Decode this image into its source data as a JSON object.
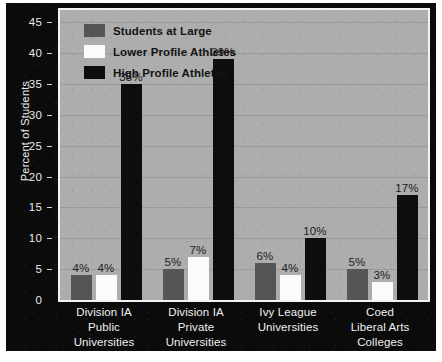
{
  "chart_data": {
    "type": "bar",
    "title": "",
    "xlabel": "",
    "ylabel": "Percent of Students",
    "ylim": [
      0,
      47
    ],
    "yticks": [
      0,
      5,
      10,
      15,
      20,
      25,
      30,
      35,
      40,
      45
    ],
    "grid": true,
    "legend_position": "top-left",
    "categories": [
      "Division IA Public Universities",
      "Division IA Private Universities",
      "Ivy League Universities",
      "Coed Liberal Arts Colleges"
    ],
    "category_lines": [
      [
        "Division IA",
        "Public",
        "Universities"
      ],
      [
        "Division IA",
        "Private",
        "Universities"
      ],
      [
        "Ivy League",
        "Universities"
      ],
      [
        "Coed",
        "Liberal Arts",
        "Colleges"
      ]
    ],
    "series": [
      {
        "name": "Students at Large",
        "color": "#555555",
        "values": [
          4,
          5,
          6,
          5
        ],
        "labels": [
          "4%",
          "5%",
          "6%",
          "5%"
        ]
      },
      {
        "name": "Lower Profile Athletes",
        "color": "#fbfbfb",
        "values": [
          4,
          7,
          4,
          3
        ],
        "labels": [
          "4%",
          "7%",
          "4%",
          "3%"
        ]
      },
      {
        "name": "High Profile Athletes",
        "color": "#0d0d0d",
        "values": [
          35,
          39,
          10,
          17
        ],
        "labels": [
          "35%",
          "39%",
          "10%",
          "17%"
        ]
      }
    ]
  },
  "colors": {
    "canvas_background": "#0b0b0b",
    "plot_background": "#adadad",
    "gridline": "#9a9a9a",
    "axis_text": "#ededed",
    "data_label_text": "#1c1c1c",
    "plot_border": "#f3f3f3"
  }
}
